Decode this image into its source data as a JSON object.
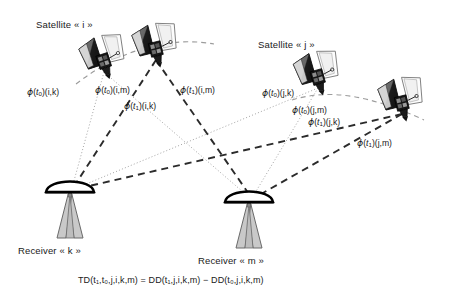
{
  "figure": {
    "title_alt": "Triple difference geometry between two satellites and two receivers",
    "background": "#ffffff",
    "ink": "#1a1a1a",
    "dotted_color": "#9a9a9a",
    "dashed_color": "#2b2b2b"
  },
  "satellites": [
    {
      "id": "i-t0",
      "label": "Satellite « i »",
      "label_x": 36,
      "label_y": 20,
      "body_x": 104,
      "body_y": 62,
      "scale": 1.0,
      "rot": -18
    },
    {
      "id": "i-t1",
      "label": "",
      "label_x": 0,
      "label_y": 0,
      "body_x": 156,
      "body_y": 50,
      "scale": 1.0,
      "rot": -14
    },
    {
      "id": "j-t0",
      "label": "Satellite « j »",
      "label_x": 258,
      "label_y": 40,
      "body_x": 318,
      "body_y": 78,
      "scale": 1.0,
      "rot": -16
    },
    {
      "id": "j-t1",
      "label": "",
      "label_x": 0,
      "label_y": 0,
      "body_x": 402,
      "body_y": 104,
      "scale": 1.0,
      "rot": -14
    }
  ],
  "orbits": [
    {
      "id": "orbit-i",
      "d": "M 76 84 C 120 50 168 36 214 44"
    },
    {
      "id": "orbit-j",
      "d": "M 292 100 C 330 88 372 96 424 120"
    }
  ],
  "receivers": [
    {
      "id": "k",
      "label": "Receiver « k »",
      "label_x": 18,
      "label_y": 246,
      "x": 70,
      "y": 190
    },
    {
      "id": "m",
      "label": "Receiver « m »",
      "label_x": 198,
      "label_y": 256,
      "x": 249,
      "y": 200
    }
  ],
  "signal_labels": [
    {
      "id": "phi-t0-i-k",
      "phi": "ϕ",
      "t": "t",
      "tsub": "0",
      "args": "(i,k)",
      "x": 27,
      "y": 87,
      "style": "dotted"
    },
    {
      "id": "phi-t0-i-m",
      "phi": "ϕ",
      "t": "t",
      "tsub": "0",
      "args": "(i,m)",
      "x": 95,
      "y": 85,
      "style": "dotted"
    },
    {
      "id": "phi-t1-i-k",
      "phi": "ϕ",
      "t": "t",
      "tsub": "1",
      "args": "(i,k)",
      "x": 124,
      "y": 101,
      "style": "dashed"
    },
    {
      "id": "phi-t1-i-m",
      "phi": "ϕ",
      "t": "t",
      "tsub": "1",
      "args": "(i,m)",
      "x": 180,
      "y": 85,
      "style": "dashed"
    },
    {
      "id": "phi-t0-j-k",
      "phi": "ϕ",
      "t": "t",
      "tsub": "0",
      "args": "(j,k)",
      "x": 262,
      "y": 88,
      "style": "dotted"
    },
    {
      "id": "phi-t0-j-m",
      "phi": "ϕ",
      "t": "t",
      "tsub": "0",
      "args": "(j,m)",
      "x": 292,
      "y": 105,
      "style": "dotted"
    },
    {
      "id": "phi-t1-j-k",
      "phi": "ϕ",
      "t": "t",
      "tsub": "1",
      "args": "(j,k)",
      "x": 308,
      "y": 117,
      "style": "dashed"
    },
    {
      "id": "phi-t1-j-m",
      "phi": "ϕ",
      "t": "t",
      "tsub": "1",
      "args": "(j,m)",
      "x": 357,
      "y": 138,
      "style": "dashed"
    }
  ],
  "rays": {
    "dotted": [
      {
        "id": "ray-t0-i-k",
        "x1": 104,
        "y1": 72,
        "x2": 72,
        "y2": 188
      },
      {
        "id": "ray-t0-i-m",
        "x1": 104,
        "y1": 72,
        "x2": 250,
        "y2": 198
      },
      {
        "id": "ray-t0-j-k",
        "x1": 318,
        "y1": 88,
        "x2": 74,
        "y2": 189
      },
      {
        "id": "ray-t0-j-m",
        "x1": 318,
        "y1": 88,
        "x2": 252,
        "y2": 198
      }
    ],
    "dashed": [
      {
        "id": "ray-t1-i-k",
        "x1": 156,
        "y1": 60,
        "x2": 73,
        "y2": 188
      },
      {
        "id": "ray-t1-i-m",
        "x1": 156,
        "y1": 60,
        "x2": 251,
        "y2": 197
      },
      {
        "id": "ray-t1-j-k",
        "x1": 402,
        "y1": 114,
        "x2": 76,
        "y2": 189
      },
      {
        "id": "ray-t1-j-m",
        "x1": 402,
        "y1": 114,
        "x2": 254,
        "y2": 198
      }
    ]
  },
  "equation": {
    "x": 78,
    "y": 276,
    "lhs_fn": "TD",
    "lhs_args": "(t₁,t₀,j,i,k,m)",
    "eq": "=",
    "rhs1_fn": "DD",
    "rhs1_args": "(t₁,j,i,k,m)",
    "minus": "−",
    "rhs2_fn": "DD",
    "rhs2_args": "(t₀,j,i,k,m)",
    "plain": "TD(t1,t0,j,i,k,m) = DD(t1,j,i,k,m) − DD(t0,j,i,k,m)"
  }
}
